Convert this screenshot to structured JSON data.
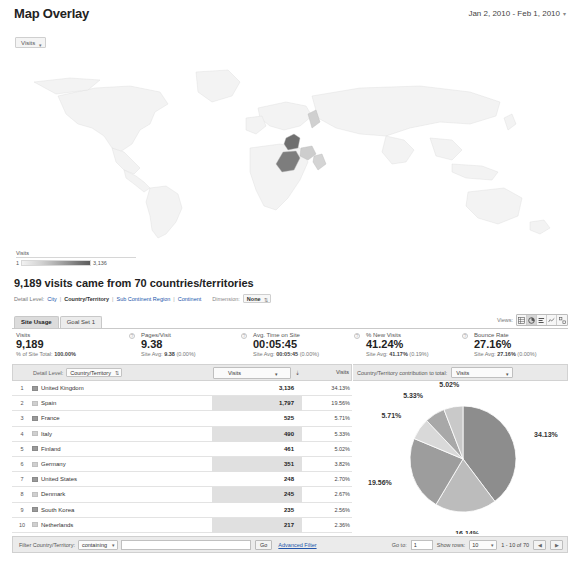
{
  "header": {
    "title": "Map Overlay",
    "date_range": "Jan 2, 2010 - Feb 1, 2010",
    "caret": "▾"
  },
  "map": {
    "metric_selector": "Visits",
    "caret": "▾",
    "legend": {
      "title": "Visits",
      "min": "1",
      "max": "3,136"
    }
  },
  "summary": {
    "headline": "9,189 visits came from 70 countries/territories",
    "detail_level_label": "Detail Level:",
    "levels": [
      "City",
      "Country/Territory",
      "Sub Continent Region",
      "Continent"
    ],
    "active_level": "Country/Territory",
    "separator": "|",
    "dimension_label": "Dimension:",
    "dimension_value": "None",
    "dimension_caret": "⇅"
  },
  "views": {
    "label": "Views:",
    "buttons": [
      "table-view",
      "pie-view",
      "bar-view",
      "comparison-view",
      "pivot-view"
    ],
    "active_index": 1
  },
  "tabs": [
    {
      "label": "Site Usage",
      "active": true
    },
    {
      "label": "Goal Set 1",
      "active": false
    }
  ],
  "metrics": [
    {
      "name": "Visits",
      "value": "9,189",
      "sub_prefix": "% of Site Total:",
      "sub_value": "100.00%",
      "sub_suffix": ""
    },
    {
      "name": "Pages/Visit",
      "value": "9.38",
      "sub_prefix": "Site Avg:",
      "sub_value": "9.38",
      "sub_suffix": "(0.00%)"
    },
    {
      "name": "Avg. Time on Site",
      "value": "00:05:45",
      "sub_prefix": "Site Avg:",
      "sub_value": "00:05:45",
      "sub_suffix": "(0.00%)"
    },
    {
      "name": "% New Visits",
      "value": "41.24%",
      "sub_prefix": "Site Avg:",
      "sub_value": "41.17%",
      "sub_suffix": "(0.19%)"
    },
    {
      "name": "Bounce Rate",
      "value": "27.16%",
      "sub_prefix": "Site Avg:",
      "sub_value": "27.16%",
      "sub_suffix": "(0.00%)"
    }
  ],
  "table": {
    "detail_level_label": "Detail Level:",
    "detail_level_value": "Country/Territory",
    "detail_level_caret": "⇅",
    "metric_selector": "Visits",
    "metric_caret": "▾",
    "sort_arrow": "⇣",
    "visits_header": "Visits",
    "pie_header_label": "Country/Territory contribution to total:",
    "pie_metric": "Visits",
    "pie_caret": "▾",
    "rows": [
      {
        "rank": "1",
        "country": "United Kingdom",
        "visits": "3,136",
        "percent": "34.13%"
      },
      {
        "rank": "2",
        "country": "Spain",
        "visits": "1,797",
        "percent": "19.56%"
      },
      {
        "rank": "3",
        "country": "France",
        "visits": "525",
        "percent": "5.71%"
      },
      {
        "rank": "4",
        "country": "Italy",
        "visits": "490",
        "percent": "5.33%"
      },
      {
        "rank": "5",
        "country": "Finland",
        "visits": "461",
        "percent": "5.02%"
      },
      {
        "rank": "6",
        "country": "Germany",
        "visits": "351",
        "percent": "3.82%"
      },
      {
        "rank": "7",
        "country": "United States",
        "visits": "248",
        "percent": "2.70%"
      },
      {
        "rank": "8",
        "country": "Denmark",
        "visits": "245",
        "percent": "2.67%"
      },
      {
        "rank": "9",
        "country": "South Korea",
        "visits": "235",
        "percent": "2.56%"
      },
      {
        "rank": "10",
        "country": "Netherlands",
        "visits": "217",
        "percent": "2.36%"
      }
    ]
  },
  "chart_data": {
    "type": "pie",
    "title": "Country/Territory contribution to total: Visits",
    "labels": [
      "United Kingdom",
      "Other",
      "Spain",
      "France",
      "Italy",
      "Finland"
    ],
    "visible_labels": [
      "34.13%",
      "16.14%",
      "19.56%",
      "5.71%",
      "5.33%",
      "5.02%"
    ],
    "values": [
      34.13,
      16.14,
      19.56,
      5.71,
      5.33,
      5.02
    ],
    "colors": [
      "#8d8d8d",
      "#bcbcbc",
      "#9d9d9d",
      "#d9d9d9",
      "#a8a8a8",
      "#c9c9c9"
    ],
    "legend": "none",
    "grid": false
  },
  "footer": {
    "filter_label": "Filter Country/Territory:",
    "filter_condition": "containing",
    "filter_caret": "▾",
    "filter_value": "",
    "go_button": "Go",
    "advanced_filter": "Advanced Filter",
    "goto_label": "Go to:",
    "goto_value": "1",
    "show_rows_label": "Show rows:",
    "show_rows_value": "10",
    "show_rows_caret": "▾",
    "range": "1 - 10 of 70",
    "prev": "◀",
    "next": "▶"
  }
}
